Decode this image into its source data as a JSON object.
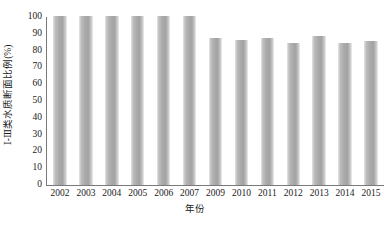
{
  "chart_data": {
    "type": "bar",
    "title": "",
    "subtitle": "",
    "xlabel": "年份",
    "ylabel": "Ⅰ-Ⅲ类水质断面比例(%)",
    "categories": [
      "2002",
      "2003",
      "2004",
      "2005",
      "2006",
      "2007",
      "2009",
      "2010",
      "2011",
      "2012",
      "2013",
      "2014",
      "2015"
    ],
    "values": [
      100,
      100,
      100,
      100,
      100,
      100,
      87,
      86,
      87,
      84,
      88,
      84,
      85
    ],
    "series": [
      {
        "name": "Ⅰ-Ⅲ类水质断面比例",
        "values": [
          100,
          100,
          100,
          100,
          100,
          100,
          87,
          86,
          87,
          84,
          88,
          84,
          85
        ]
      }
    ],
    "ylim": [
      0,
      100
    ],
    "ytick_values": [
      0,
      10,
      20,
      30,
      40,
      50,
      60,
      70,
      80,
      90,
      100
    ],
    "ytick_labels": [
      "0",
      "10",
      "20",
      "30",
      "40",
      "50",
      "60",
      "70",
      "80",
      "90",
      "100"
    ],
    "xtick_labels": [
      "2002",
      "2003",
      "2004",
      "2005",
      "2006",
      "2007",
      "2009",
      "2010",
      "2011",
      "2012",
      "2013",
      "2014",
      "2015"
    ],
    "grid": false,
    "legend": false,
    "legend_position": "none",
    "annotations": [],
    "bar_color": "#a9a9a9",
    "axis_color": "#7a7a7a",
    "background_color": "#ffffff"
  }
}
